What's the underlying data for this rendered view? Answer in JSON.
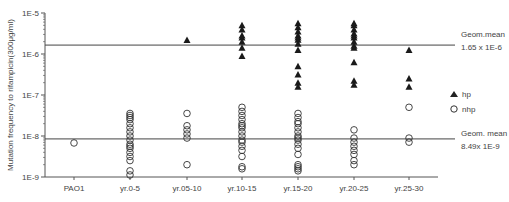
{
  "chart_data": {
    "type": "scatter",
    "title": "",
    "xlabel": "",
    "ylabel": "Mutation frequency to rifampicin(300μg/ml)",
    "yscale": "log",
    "ylim": [
      1e-09,
      1e-05
    ],
    "yticks": [
      "1E-9",
      "1E-8",
      "1E-7",
      "1E-6",
      "1E-5"
    ],
    "categories": [
      "PAO1",
      "yr.0-5",
      "yr.05-10",
      "yr.10-15",
      "yr.15-20",
      "yr.20-25",
      "yr.25-30"
    ],
    "grid": false,
    "legend_position": "right",
    "series": [
      {
        "name": "hp",
        "marker": "filled-triangle",
        "log10_values": [
          [],
          [],
          [
            -5.66
          ],
          [
            -5.3,
            -5.4,
            -5.55,
            -5.6,
            -5.7,
            -5.85,
            -6.05
          ],
          [
            -5.25,
            -5.35,
            -5.45,
            -5.55,
            -5.6,
            -5.65,
            -5.75,
            -5.9,
            -6.3,
            -6.5,
            -6.7,
            -6.8
          ],
          [
            -5.25,
            -5.3,
            -5.4,
            -5.5,
            -5.55,
            -5.6,
            -5.7,
            -5.8,
            -5.85,
            -6.2,
            -6.65,
            -6.75
          ],
          [
            -5.9,
            -6.6,
            -6.8
          ]
        ]
      },
      {
        "name": "nhp",
        "marker": "open-circle",
        "log10_values": [
          [
            -8.17
          ],
          [
            -7.45,
            -7.5,
            -7.55,
            -7.6,
            -7.7,
            -7.8,
            -7.9,
            -8.0,
            -8.1,
            -8.2,
            -8.25,
            -8.3,
            -8.4,
            -8.5,
            -8.6,
            -8.85,
            -8.95
          ],
          [
            -7.45,
            -7.75,
            -7.85,
            -7.95,
            -8.05,
            -8.7
          ],
          [
            -7.3,
            -7.4,
            -7.5,
            -7.6,
            -7.7,
            -7.75,
            -7.8,
            -7.9,
            -8.0,
            -8.1,
            -8.15,
            -8.25,
            -8.35,
            -8.5,
            -8.75,
            -8.8
          ],
          [
            -7.45,
            -7.55,
            -7.65,
            -7.7,
            -7.8,
            -7.9,
            -8.0,
            -8.05,
            -8.1,
            -8.2,
            -8.3,
            -8.45,
            -8.7,
            -8.75,
            -8.8,
            -8.85
          ],
          [
            -7.85,
            -8.05,
            -8.15,
            -8.25,
            -8.35,
            -8.45,
            -8.6,
            -8.7
          ],
          [
            -7.3,
            -8.05,
            -8.15
          ]
        ]
      }
    ],
    "reference_lines": [
      {
        "name": "Geom.mean hp",
        "value": 1.65e-06,
        "label_line1": "Geom.mean",
        "label_line2": "1.65 x 1E-6"
      },
      {
        "name": "Geom.mean nhp",
        "value": 8.49e-09,
        "label_line1": "Geom. mean",
        "label_line2": "8.49x 1E-9"
      }
    ]
  },
  "labels": {
    "ylabel": "Mutation frequency to rifampicin(300μg/ml)",
    "legend_hp": "hp",
    "legend_nhp": "nhp",
    "geom_hp_1": "Geom.mean",
    "geom_hp_2": "1.65 x 1E-6",
    "geom_nhp_1": "Geom. mean",
    "geom_nhp_2": "8.49x 1E-9"
  }
}
